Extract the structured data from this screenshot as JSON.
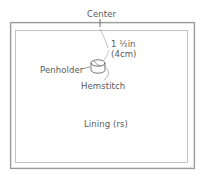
{
  "diagram": {
    "labels": {
      "center": "Center",
      "measure_imperial": "1 ½in",
      "measure_metric": "(4cm)",
      "penholder": "Penholder",
      "hemstitch": "Hemstitch",
      "lining": "Lining (rs)"
    },
    "colors": {
      "line": "#8a8a8a",
      "outer_frame": "#9a9a9a",
      "inner_frame": "#b5b5b5",
      "text": "#5a5a5a",
      "background": "#ffffff"
    },
    "parts": [
      {
        "name": "outer-panel",
        "description": "outer fabric panel outline"
      },
      {
        "name": "lining-panel",
        "description": "inner lining outline"
      },
      {
        "name": "center-mark",
        "description": "tick marking center of top edge"
      },
      {
        "name": "penholder",
        "description": "small cylindrical penholder loop"
      }
    ]
  }
}
